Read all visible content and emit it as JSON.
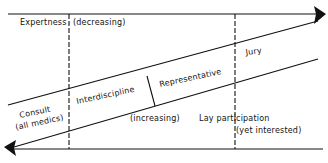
{
  "diagram": {
    "labels": {
      "expertness": "Expertness",
      "decreasing": "(decreasing)",
      "jury": "Jury",
      "representative": "Representative",
      "interdiscipline": "Interdiscipline",
      "consult": "Consult",
      "all_medics": "(all medics)",
      "increasing": "(increasing)",
      "lay_participation": "Lay participation",
      "yet_interested": "(yet interested)"
    },
    "colors": {
      "line": "#111111",
      "background": "#ffffff"
    }
  }
}
